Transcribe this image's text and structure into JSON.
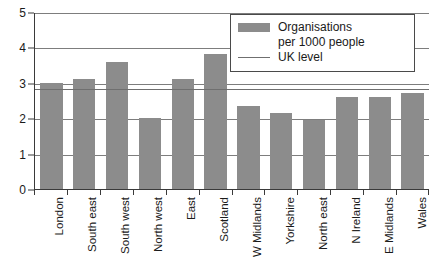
{
  "chart_data": {
    "type": "bar",
    "title": "",
    "xlabel": "",
    "ylabel": "",
    "ylim": [
      0,
      5
    ],
    "yticks": [
      0,
      1,
      2,
      3,
      4,
      5
    ],
    "grid": true,
    "grid_axis": "y",
    "legend_position": "top-right",
    "categories": [
      "London",
      "South east",
      "South west",
      "North west",
      "East",
      "Scotland",
      "W Midlands",
      "Yorkshire",
      "North east",
      "N Ireland",
      "E Midlands",
      "Wales"
    ],
    "series": [
      {
        "name": "Organisations per 1000 people",
        "type": "bar",
        "color": "#8c8c8c",
        "values": [
          3.0,
          3.1,
          3.6,
          2.0,
          3.1,
          3.8,
          2.35,
          2.15,
          1.95,
          2.6,
          2.6,
          2.7
        ]
      },
      {
        "name": "UK level",
        "type": "reference-line",
        "color": "#6f6f6f",
        "value": 2.85
      }
    ]
  },
  "legend": {
    "bar_label_line1": "Organisations",
    "bar_label_line2": "per 1000 people",
    "line_label": "UK level"
  }
}
